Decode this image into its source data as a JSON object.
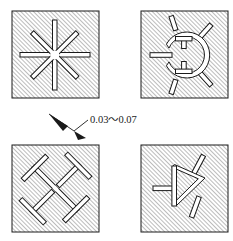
{
  "figure": {
    "background_color": "#ffffff",
    "line_color": "#1a1a1a",
    "hatch_color": "#4d4d4d",
    "slot_fill_color": "#ffffff",
    "hatch_angle_degrees": 45,
    "hatch_spacing_px": 3
  },
  "annotation": {
    "dimension_text": "0.03～0.07",
    "leader_target_label": "slot-width-callout",
    "arrowhead_style": "solid-filled"
  },
  "panels": [
    {
      "id": "panel-top-left",
      "label": "eight-spoke-star-slot",
      "position": "top-left",
      "x": 12,
      "y": 11,
      "width": 87,
      "height": 87,
      "pattern": "radial star with 8 spokes at 45 degree intervals"
    },
    {
      "id": "panel-top-right",
      "label": "c-ring-with-spurs-slot",
      "position": "top-right",
      "x": 141,
      "y": 11,
      "width": 87,
      "height": 87,
      "pattern": "open C ring with inward stubs and outward radial spurs"
    },
    {
      "id": "panel-bottom-left",
      "label": "pinwheel-t-slots",
      "position": "bottom-left",
      "x": 12,
      "y": 145,
      "width": 87,
      "height": 87,
      "pattern": "four T-shaped slots in rotational pinwheel symmetry"
    },
    {
      "id": "panel-bottom-right",
      "label": "chevron-branch-slot",
      "position": "bottom-right",
      "x": 141,
      "y": 145,
      "width": 87,
      "height": 87,
      "pattern": "triangular chevron slot with two angled branch spurs and left stub"
    }
  ]
}
